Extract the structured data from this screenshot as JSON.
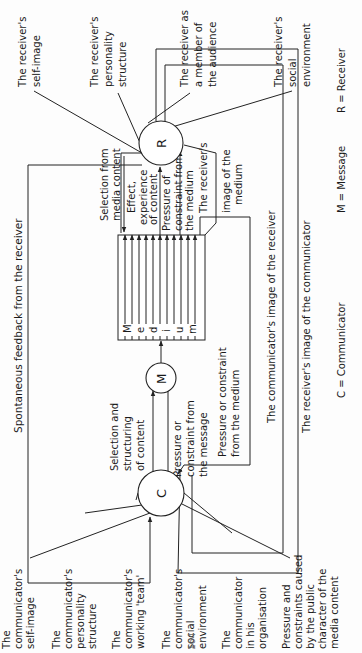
{
  "diagram": {
    "nodes": {
      "communicator": {
        "symbol": "C"
      },
      "message": {
        "symbol": "M"
      },
      "medium": {
        "letters": [
          "M",
          "e",
          "d",
          "i",
          "u",
          "m"
        ]
      },
      "receiver": {
        "symbol": "R"
      }
    },
    "communicator_factors": [
      [
        "The",
        "communicator's",
        "self-image"
      ],
      [
        "The",
        "communicator's",
        "personality",
        "structure"
      ],
      [
        "The",
        "communicator's",
        "working 'team'"
      ],
      [
        "The",
        "communicator's",
        "social",
        "environment"
      ],
      [
        "The",
        "communicator",
        "in his",
        "organisation"
      ],
      [
        "Pressure and",
        "constraints caused",
        "by the public",
        "character of the",
        "media content"
      ]
    ],
    "receiver_factors": [
      [
        "The receiver's",
        "self-image"
      ],
      [
        "The receiver's",
        "personality",
        "structure"
      ],
      [
        "The receiver as",
        "a member of",
        "the audience"
      ],
      [
        "The receiver's",
        "social",
        "environment"
      ]
    ],
    "flows": {
      "spontaneous_feedback": "Spontaneous feedback from the receiver",
      "selection_structuring": [
        "Selection and",
        "structuring",
        "of content"
      ],
      "pressure_message": [
        "Pressure or",
        "constraint from",
        "the message"
      ],
      "pressure_medium_c": [
        "Pressure or constraint",
        "from the medium"
      ],
      "comm_image_receiver": "The communicator's image of the receiver",
      "recv_image_communicator": "The receiver's image of the communicator",
      "selection_media_content": [
        "Selection from",
        "media content"
      ],
      "effect_experience": [
        "Effect,",
        "experience",
        "of content"
      ],
      "pressure_medium_r": [
        "Pressure of",
        "constraint from",
        "the medium"
      ],
      "receiver_image_medium": [
        "The receiver's",
        "image of the",
        "medium"
      ]
    },
    "legend": {
      "c": "C = Communicator",
      "m": "M = Message",
      "r": "R = Receiver"
    },
    "page_number": "164"
  }
}
